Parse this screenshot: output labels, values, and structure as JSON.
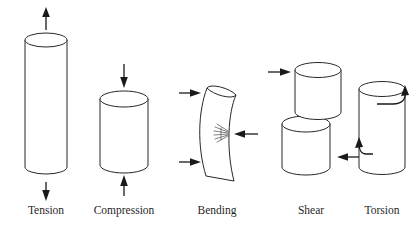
{
  "figure": {
    "title": "",
    "background_color": "#ffffff",
    "line_color": "#272727",
    "arrow_color": "#1a1a1a",
    "label_color": "#1f1f1f"
  },
  "modes": [
    {
      "id": "tension",
      "label": "Tension",
      "label_x": 46,
      "label_y": 214,
      "shape": "tall-cylinder",
      "arrows": "one arrow pointing up above the cylinder, one arrow pointing down below the cylinder"
    },
    {
      "id": "compression",
      "label": "Compression",
      "label_x": 124,
      "label_y": 214,
      "shape": "short-cylinder",
      "arrows": "one arrow pointing down above the cylinder, one arrow pointing up below the cylinder"
    },
    {
      "id": "bending",
      "label": "Bending",
      "label_x": 217,
      "label_y": 214,
      "shape": "curved-cylinder",
      "arrows": "two arrows pointing right on the left side, one arrow pointing left at mid-height on the right side",
      "detail": "crack hatch marks at the right mid-height of the bent member"
    },
    {
      "id": "shear",
      "label": "Shear",
      "label_x": 311,
      "label_y": 214,
      "shape": "two-offset-cylinder-blocks",
      "arrows": "one arrow pointing right at the upper block, one arrow pointing left at the lower block"
    },
    {
      "id": "torsion",
      "label": "Torsion",
      "label_x": 382,
      "label_y": 214,
      "shape": "cylinder-with-twist",
      "arrows": "curved rotational arrow at the top wrapping to the right, curved rotational arrow at the bottom wrapping to the left"
    }
  ]
}
